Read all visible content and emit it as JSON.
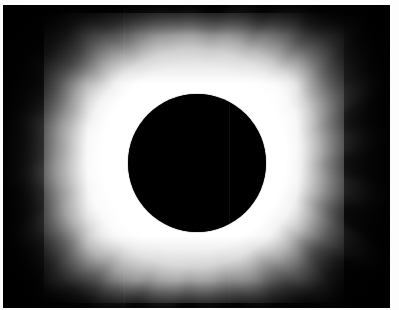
{
  "image": {
    "kind": "photograph",
    "subject": "total-solar-eclipse",
    "alt_text": "Total solar eclipse: black lunar disk surrounded by a bright white solar corona with radial streamers on a dark sky",
    "caption": "",
    "width_px": 399,
    "height_px": 310
  },
  "frame": {
    "border_color": "#ffffff",
    "border_left_px": 3,
    "border_top_px": 5,
    "border_right_px": 9,
    "border_bottom_px": 2,
    "photo_width_px": 387,
    "photo_height_px": 303
  },
  "palette": {
    "sky_black": "#000000",
    "moon_black": "#000000",
    "corona_white": "#ffffff",
    "corona_mid_gray": "#b4b4b4",
    "sky_edge_gray": "#101010",
    "paper_white": "#fdfdfd"
  },
  "occulting_disk": {
    "label": "lunar-disk",
    "center_x_px": 197,
    "center_y_px": 163,
    "radius_x_px": 69,
    "radius_y_px": 69,
    "fill": "#000000"
  },
  "corona": {
    "label": "solar-corona",
    "shape": "equatorially-elongated",
    "brightest_quadrant": "lower-left",
    "secondary_bright_quadrant": "upper-right",
    "max_extent_desc": "fills frame horizontally, fades to black at corners",
    "streamers": [
      {
        "name": "streamer-n-1",
        "angle_deg": -104,
        "length_px": 175,
        "width_px": 26,
        "intensity": 0.8
      },
      {
        "name": "streamer-n-2",
        "angle_deg": -92,
        "length_px": 168,
        "width_px": 20,
        "intensity": 0.72
      },
      {
        "name": "streamer-ne-1",
        "angle_deg": -74,
        "length_px": 182,
        "width_px": 28,
        "intensity": 0.85
      },
      {
        "name": "streamer-ne-2",
        "angle_deg": -58,
        "length_px": 196,
        "width_px": 30,
        "intensity": 0.88
      },
      {
        "name": "streamer-ne-3",
        "angle_deg": -42,
        "length_px": 205,
        "width_px": 26,
        "intensity": 0.78
      },
      {
        "name": "streamer-e-1",
        "angle_deg": -24,
        "length_px": 190,
        "width_px": 22,
        "intensity": 0.62
      },
      {
        "name": "streamer-e-2",
        "angle_deg": -8,
        "length_px": 178,
        "width_px": 24,
        "intensity": 0.58
      },
      {
        "name": "streamer-e-3",
        "angle_deg": 10,
        "length_px": 186,
        "width_px": 26,
        "intensity": 0.6
      },
      {
        "name": "streamer-se-1",
        "angle_deg": 28,
        "length_px": 198,
        "width_px": 28,
        "intensity": 0.7
      },
      {
        "name": "streamer-se-2",
        "angle_deg": 46,
        "length_px": 186,
        "width_px": 26,
        "intensity": 0.72
      },
      {
        "name": "streamer-s-1",
        "angle_deg": 66,
        "length_px": 165,
        "width_px": 24,
        "intensity": 0.66
      },
      {
        "name": "streamer-s-2",
        "angle_deg": 86,
        "length_px": 152,
        "width_px": 22,
        "intensity": 0.6
      },
      {
        "name": "streamer-sw-1",
        "angle_deg": 104,
        "length_px": 168,
        "width_px": 30,
        "intensity": 0.86
      },
      {
        "name": "streamer-sw-2",
        "angle_deg": 122,
        "length_px": 180,
        "width_px": 32,
        "intensity": 0.92
      },
      {
        "name": "streamer-sw-3",
        "angle_deg": 140,
        "length_px": 178,
        "width_px": 28,
        "intensity": 0.88
      },
      {
        "name": "streamer-w-1",
        "angle_deg": 158,
        "length_px": 172,
        "width_px": 26,
        "intensity": 0.76
      },
      {
        "name": "streamer-w-2",
        "angle_deg": 176,
        "length_px": 166,
        "width_px": 24,
        "intensity": 0.66
      },
      {
        "name": "streamer-w-3",
        "angle_deg": 194,
        "length_px": 160,
        "width_px": 22,
        "intensity": 0.62
      },
      {
        "name": "streamer-nw-1",
        "angle_deg": 212,
        "length_px": 170,
        "width_px": 24,
        "intensity": 0.64
      },
      {
        "name": "streamer-nw-2",
        "angle_deg": 230,
        "length_px": 176,
        "width_px": 26,
        "intensity": 0.68
      },
      {
        "name": "streamer-nw-3",
        "angle_deg": 248,
        "length_px": 168,
        "width_px": 22,
        "intensity": 0.6
      },
      {
        "name": "streamer-nnw-1",
        "angle_deg": 264,
        "length_px": 160,
        "width_px": 20,
        "intensity": 0.58
      }
    ]
  },
  "artifacts": {
    "seam_lines": [
      {
        "name": "scan-seam-left",
        "x_px": 124,
        "opacity": 0.1
      },
      {
        "name": "scan-seam-lower",
        "x_px": 229,
        "opacity": 0.07
      }
    ],
    "grain_opacity": 0.055
  }
}
